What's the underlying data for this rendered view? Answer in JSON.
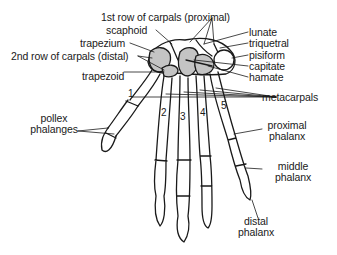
{
  "diagram": {
    "fill_color": "#c4c4c4",
    "line_color": "#1a1a1a",
    "labels": {
      "first_row": "1st row of carpals (proximal)",
      "scaphoid": "scaphoid",
      "trapezium": "trapezium",
      "second_row": "2nd row of carpals (distal)",
      "trapezoid": "trapezoid",
      "lunate": "lunate",
      "triquetral": "triquetral",
      "pisiform": "pisiform",
      "capitate": "capitate",
      "hamate": "hamate",
      "metacarpals": "metacarpals",
      "pollex_line1": "pollex",
      "pollex_line2": "phalanges",
      "proximal_line1": "proximal",
      "proximal_line2": "phalanx",
      "middle_line1": "middle",
      "middle_line2": "phalanx",
      "distal_line1": "distal",
      "distal_line2": "phalanx"
    },
    "metacarpal_numbers": [
      "1",
      "2",
      "3",
      "4",
      "5"
    ]
  }
}
